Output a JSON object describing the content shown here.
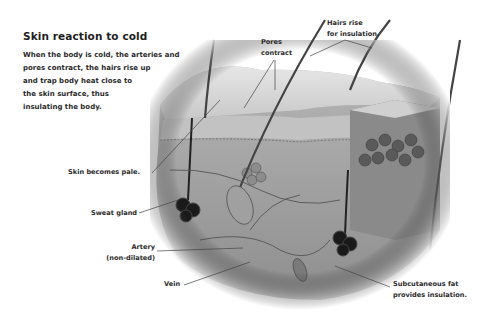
{
  "diagram": {
    "title": "Skin reaction to cold",
    "description_lines": [
      "When the body is cold, the arteries and",
      "pores contract, the hairs rise up",
      "and trap body heat close to",
      "the skin surface, thus",
      "insulating the body."
    ],
    "labels": {
      "pores": [
        "Pores",
        "contract"
      ],
      "hairs": [
        "Hairs rise",
        "for insulation."
      ],
      "pale": "Skin becomes pale.",
      "sweat": "Sweat gland",
      "artery": [
        "Artery",
        "(non-dilated)"
      ],
      "vein": "Vein",
      "fat": [
        "Subcutaneous fat",
        "provides insulation."
      ]
    },
    "colors": {
      "background": "#ffffff",
      "text": "#2a2a2a",
      "skin_surface": "#d4d4d4",
      "tissue": "#9a9a9a",
      "gland": "#1a1a1a"
    }
  }
}
